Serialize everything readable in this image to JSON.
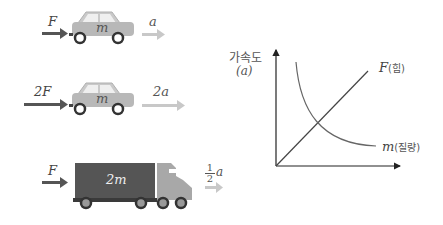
{
  "scenes": [
    {
      "force_label": "F",
      "mass_label": "m",
      "accel_label": "a"
    },
    {
      "force_label": "2F",
      "mass_label": "m",
      "accel_label": "2a"
    },
    {
      "force_label": "F",
      "mass_label": "2m",
      "accel_num": "1",
      "accel_den": "2",
      "accel_var": "a"
    }
  ],
  "graph": {
    "y_axis_label": "가속도",
    "y_axis_symbol": "(a)",
    "line_label_var": "F",
    "line_label_kor": "(힘)",
    "curve_label_var": "m",
    "curve_label_kor": "(질량)"
  },
  "colors": {
    "force_arrow": "#555555",
    "accel_arrow": "#c8c8c8",
    "car_body": "#b8b8b8",
    "truck_cargo": "#555555",
    "truck_cab": "#a8a8a8",
    "wheel": "#333333",
    "axis": "#222222"
  }
}
